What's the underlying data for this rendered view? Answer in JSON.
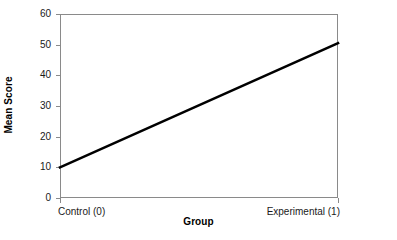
{
  "chart_data": {
    "type": "line",
    "title": "",
    "subtitle": "",
    "xlabel": "Group",
    "ylabel": "Mean Score",
    "xlim": [
      0,
      1
    ],
    "ylim": [
      0,
      60
    ],
    "grid": false,
    "legend": false,
    "legend_position": "none",
    "x_tick_labels": [
      "Control (0)",
      "Experimental (1)"
    ],
    "x_tick_values": [
      0,
      1
    ],
    "y_tick_labels": [
      "0",
      "10",
      "20",
      "30",
      "40",
      "50",
      "60"
    ],
    "y_tick_values": [
      0,
      10,
      20,
      30,
      40,
      50,
      60
    ],
    "series": [
      {
        "name": "Mean Score",
        "x": [
          0,
          1
        ],
        "values": [
          10,
          50.5
        ],
        "color": "#000000",
        "line_width": 2.6,
        "markers": "none"
      }
    ],
    "annotations": []
  },
  "style": {
    "background": "#ffffff",
    "axis_color": "#8a8a8a",
    "tick_label_color": "#1a1a1a",
    "axis_title_color": "#000000",
    "series_color": "#000000"
  }
}
